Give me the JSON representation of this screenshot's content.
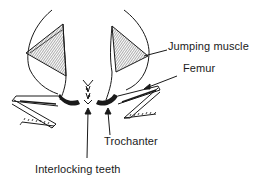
{
  "labels": {
    "jumping_muscle": "Jumping muscle",
    "femur": "Femur",
    "trochanter": "Trochanter",
    "interlocking_teeth": "Interlocking teeth"
  },
  "colors": {
    "ink": "#1a1a1a",
    "background": "#ffffff"
  }
}
